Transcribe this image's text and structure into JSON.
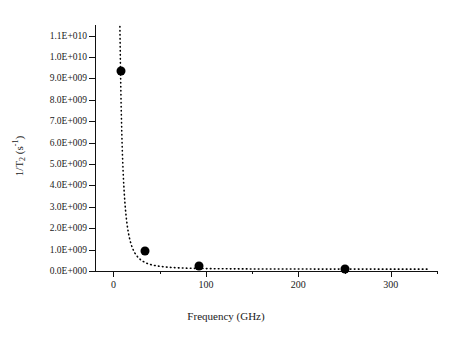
{
  "chart_data": {
    "type": "scatter",
    "title": "",
    "xlabel": "Frequency (GHz)",
    "ylabel": "1/T2 (s-1)",
    "ylabel_parts": {
      "prefix": "1/T",
      "sub": "2",
      "mid": " (s",
      "sup": "-1",
      "suffix": ")"
    },
    "x": [
      7.6,
      34,
      92,
      250
    ],
    "values": [
      9350000000.0,
      930000000.0,
      230000000.0,
      100000000.0
    ],
    "points": [
      {
        "x": 7.6,
        "y": 9350000000
      },
      {
        "x": 34,
        "y": 930000000
      },
      {
        "x": 92,
        "y": 230000000
      },
      {
        "x": 250,
        "y": 100000000
      }
    ],
    "xlim": [
      -20,
      350
    ],
    "ylim": [
      0.0,
      11500000000
    ],
    "xticks": [
      0,
      100,
      200,
      300
    ],
    "xtick_labels": [
      "0",
      "100",
      "200",
      "300"
    ],
    "x_minor_ticks": [
      50,
      150,
      250,
      350
    ],
    "yticks": [
      0,
      1000000000,
      2000000000,
      3000000000,
      4000000000,
      5000000000,
      6000000000,
      7000000000,
      8000000000,
      9000000000,
      10000000000,
      11000000000
    ],
    "ytick_labels": [
      "0.0E+000",
      "1.0E+009",
      "2.0E+009",
      "3.0E+009",
      "4.0E+009",
      "5.0E+009",
      "6.0E+009",
      "7.0E+009",
      "8.0E+009",
      "9.0E+009",
      "1.0E+010",
      "1.1E+010"
    ],
    "grid": false,
    "legend": null,
    "fit_curve": {
      "style": "dotted",
      "description": "decaying hyperbolic fit through the four points"
    },
    "marker": {
      "shape": "circle",
      "color": "#000000",
      "size": 9
    },
    "line_color": "#000000",
    "background": "#ffffff"
  }
}
